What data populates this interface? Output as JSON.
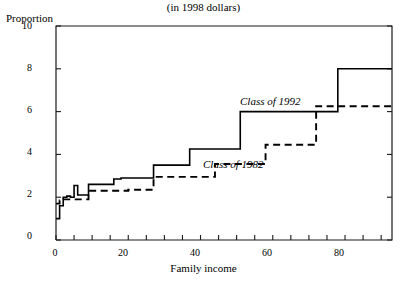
{
  "chart_data": {
    "type": "line",
    "title": "(in 1998 dollars)",
    "xlabel": "Family income",
    "ylabel": "Proportion",
    "xlim": [
      0,
      93
    ],
    "ylim": [
      0,
      10
    ],
    "grid": false,
    "legend_position": "inline-annotations",
    "y_ticks": [
      0,
      2,
      4,
      6,
      8,
      10
    ],
    "y_tick_labels": [
      "0",
      "2",
      "4",
      "6",
      "8",
      "10"
    ],
    "x_ticks": [
      0,
      5,
      10,
      15,
      20,
      25,
      30,
      35,
      40,
      45,
      50,
      55,
      60,
      65,
      70,
      75,
      80,
      85,
      90
    ],
    "x_tick_labels_shown": {
      "0": "0",
      "20": "20",
      "40": "40",
      "60": "60",
      "80": "80"
    },
    "interpolation": "step",
    "series": [
      {
        "name": "Class of 1992",
        "style": "solid",
        "color": "#000000",
        "x": [
          0,
          1,
          2,
          3,
          4,
          5,
          6,
          7,
          9,
          11,
          13,
          16,
          18,
          20,
          23,
          26,
          27,
          31,
          36,
          37,
          43,
          50,
          51,
          58,
          62,
          71,
          72,
          77,
          78,
          93
        ],
        "y": [
          1.0,
          1.6,
          2.0,
          2.05,
          2.0,
          2.55,
          2.1,
          2.1,
          2.6,
          2.6,
          2.6,
          2.85,
          2.9,
          2.9,
          2.9,
          2.9,
          3.5,
          3.5,
          3.5,
          4.25,
          4.25,
          4.25,
          6.0,
          6.0,
          6.0,
          6.0,
          6.0,
          6.0,
          8.0,
          8.0
        ]
      },
      {
        "name": "Class of 1982",
        "style": "dashed",
        "color": "#000000",
        "x": [
          0,
          1,
          2,
          3,
          5,
          7,
          9,
          10,
          13,
          16,
          20,
          24,
          26,
          27,
          31,
          36,
          37,
          43,
          44,
          50,
          56,
          58,
          62,
          66,
          71,
          72,
          77,
          93
        ],
        "y": [
          1.7,
          1.85,
          1.9,
          1.9,
          1.9,
          1.9,
          2.3,
          2.3,
          2.3,
          2.3,
          2.35,
          2.35,
          2.35,
          2.95,
          2.95,
          2.95,
          2.95,
          2.95,
          3.55,
          3.55,
          3.55,
          4.45,
          4.45,
          4.45,
          4.45,
          6.25,
          6.25,
          6.25
        ]
      }
    ],
    "annotations": [
      {
        "text": "Class of 1992",
        "x": 50,
        "y": 6.8,
        "style": "italic"
      },
      {
        "text": "Class of 1982",
        "x": 38,
        "y": 3.9,
        "style": "italic"
      }
    ]
  },
  "labels": {
    "title": "(in 1998 dollars)",
    "ylabel": "Proportion",
    "xlabel": "Family income",
    "series1": "Class of 1992",
    "series2": "Class of 1982"
  },
  "axis": {
    "y_labels": [
      "10",
      "8",
      "6",
      "4",
      "2",
      "0"
    ],
    "x_labels": [
      "0",
      "20",
      "40",
      "60",
      "80"
    ]
  },
  "colors": {
    "line": "#000000",
    "axis": "#1a1a1a",
    "background": "#ffffff"
  }
}
